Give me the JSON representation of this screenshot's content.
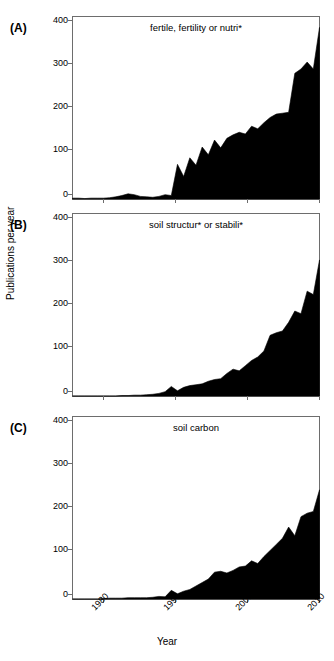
{
  "figure": {
    "xlabel": "Year",
    "ylabel": "Publications per year",
    "panel_letters": [
      "(A)",
      "(B)",
      "(C)"
    ],
    "area_color": "#000000",
    "frame_color": "#6d6d6d",
    "background": "#ffffff"
  },
  "chart_data": [
    {
      "type": "area",
      "panel": "(A)",
      "title": "fertile, fertility or nutri*",
      "xlabel": "Year",
      "ylabel": "Publications per year",
      "xlim": [
        1975,
        2015
      ],
      "ylim": [
        0,
        420
      ],
      "xticks": [
        1980,
        1990,
        2000,
        2010
      ],
      "yticks": [
        0,
        100,
        200,
        300,
        400
      ],
      "grid": false,
      "legend": "none",
      "x": [
        1975,
        1976,
        1977,
        1978,
        1979,
        1980,
        1981,
        1982,
        1983,
        1984,
        1985,
        1986,
        1987,
        1988,
        1989,
        1990,
        1991,
        1992,
        1993,
        1994,
        1995,
        1996,
        1997,
        1998,
        1999,
        2000,
        2001,
        2002,
        2003,
        2004,
        2005,
        2006,
        2007,
        2008,
        2009,
        2010,
        2011,
        2012,
        2013,
        2014,
        2015
      ],
      "values": [
        2,
        2,
        1,
        2,
        2,
        2,
        3,
        5,
        8,
        12,
        10,
        6,
        5,
        4,
        6,
        10,
        8,
        80,
        52,
        95,
        78,
        120,
        102,
        136,
        118,
        140,
        148,
        154,
        150,
        168,
        162,
        176,
        188,
        196,
        198,
        200,
        290,
        300,
        316,
        300,
        396
      ]
    },
    {
      "type": "area",
      "panel": "(B)",
      "title": "soil structur* or stabili*",
      "xlabel": "Year",
      "ylabel": "Publications per year",
      "xlim": [
        1975,
        2015
      ],
      "ylim": [
        0,
        420
      ],
      "xticks": [
        1980,
        1990,
        2000,
        2010
      ],
      "yticks": [
        0,
        100,
        200,
        300,
        400
      ],
      "grid": false,
      "legend": "none",
      "x": [
        1975,
        1976,
        1977,
        1978,
        1979,
        1980,
        1981,
        1982,
        1983,
        1984,
        1985,
        1986,
        1987,
        1988,
        1989,
        1990,
        1991,
        1992,
        1993,
        1994,
        1995,
        1996,
        1997,
        1998,
        1999,
        2000,
        2001,
        2002,
        2003,
        2004,
        2005,
        2006,
        2007,
        2008,
        2009,
        2010,
        2011,
        2012,
        2013,
        2014,
        2015
      ],
      "values": [
        0,
        0,
        0,
        0,
        0,
        0,
        0,
        0,
        1,
        1,
        2,
        2,
        3,
        4,
        6,
        10,
        22,
        12,
        20,
        24,
        26,
        28,
        34,
        38,
        40,
        52,
        62,
        58,
        70,
        82,
        90,
        104,
        140,
        146,
        150,
        170,
        196,
        190,
        242,
        234,
        314
      ]
    },
    {
      "type": "area",
      "panel": "(C)",
      "title": "soil carbon",
      "xlabel": "Year",
      "ylabel": "Publications per year",
      "xlim": [
        1975,
        2015
      ],
      "ylim": [
        0,
        420
      ],
      "xticks": [
        1980,
        1990,
        2000,
        2010
      ],
      "yticks": [
        0,
        100,
        200,
        300,
        400
      ],
      "grid": false,
      "legend": "none",
      "x": [
        1975,
        1976,
        1977,
        1978,
        1979,
        1980,
        1981,
        1982,
        1983,
        1984,
        1985,
        1986,
        1987,
        1988,
        1989,
        1990,
        1991,
        1992,
        1993,
        1994,
        1995,
        1996,
        1997,
        1998,
        1999,
        2000,
        2001,
        2002,
        2003,
        2004,
        2005,
        2006,
        2007,
        2008,
        2009,
        2010,
        2011,
        2012,
        2013,
        2014,
        2015
      ],
      "values": [
        0,
        0,
        0,
        0,
        0,
        1,
        2,
        2,
        2,
        3,
        3,
        3,
        3,
        4,
        6,
        5,
        20,
        12,
        18,
        22,
        30,
        38,
        46,
        62,
        64,
        60,
        66,
        74,
        76,
        88,
        82,
        98,
        112,
        126,
        140,
        166,
        146,
        190,
        198,
        202,
        252
      ]
    }
  ]
}
